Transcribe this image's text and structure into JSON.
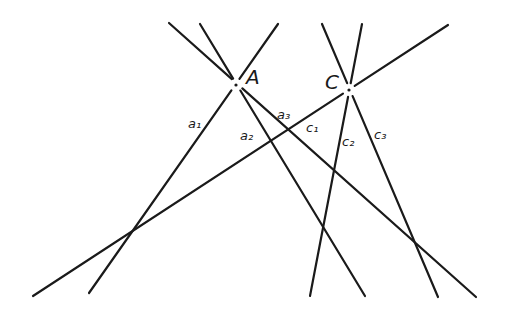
{
  "diagram": {
    "title": "",
    "points": [
      {
        "id": "A",
        "label": "A",
        "x": 236,
        "y": 85,
        "label_x": 246,
        "label_y": 84
      },
      {
        "id": "C",
        "label": "C",
        "x": 349,
        "y": 90,
        "label_x": 325,
        "label_y": 89
      }
    ],
    "lines": [
      {
        "id": "c1-long",
        "name": "c1",
        "x1": 33,
        "y1": 296,
        "x2": 448,
        "y2": 25
      },
      {
        "id": "a1",
        "name": "a1",
        "x1": 278,
        "y1": 24,
        "x2": 89,
        "y2": 293
      },
      {
        "id": "a2",
        "name": "a2",
        "x1": 200,
        "y1": 24,
        "x2": 365,
        "y2": 296
      },
      {
        "id": "a3",
        "name": "a3",
        "x1": 169,
        "y1": 23,
        "x2": 476,
        "y2": 297
      },
      {
        "id": "c2",
        "name": "c2",
        "x1": 362,
        "y1": 24,
        "x2": 310,
        "y2": 296
      },
      {
        "id": "c3",
        "name": "c3",
        "x1": 322,
        "y1": 24,
        "x2": 438,
        "y2": 297
      }
    ],
    "labels": [
      {
        "id": "a1",
        "text": "a₁",
        "x": 188,
        "y": 128
      },
      {
        "id": "a2",
        "text": "a₂",
        "x": 240,
        "y": 140
      },
      {
        "id": "a3",
        "text": "a₃",
        "x": 277,
        "y": 119
      },
      {
        "id": "c1",
        "text": "c₁",
        "x": 306,
        "y": 132
      },
      {
        "id": "c2",
        "text": "c₂",
        "x": 342,
        "y": 146
      },
      {
        "id": "c3",
        "text": "c₃",
        "x": 374,
        "y": 139
      }
    ]
  }
}
